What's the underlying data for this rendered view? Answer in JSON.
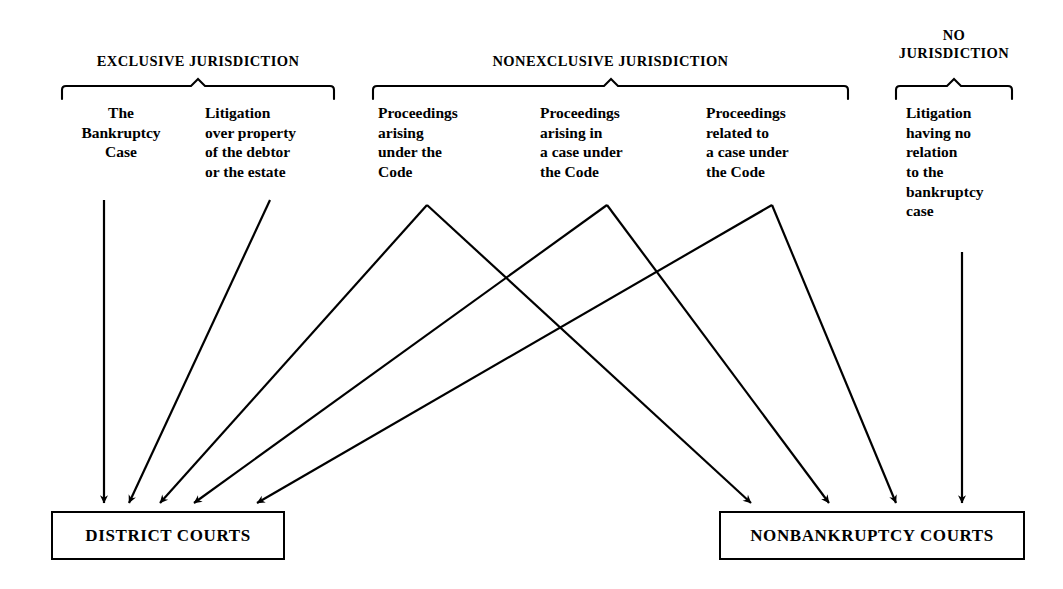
{
  "page": {
    "background_color": "#ffffff",
    "ink_color": "#000000"
  },
  "groups": [
    {
      "id": "exclusive",
      "heading": "EXCLUSIVE JURISDICTION",
      "brace": {
        "x_start": 62,
        "x_end": 334,
        "y": 86
      },
      "heading_box": {
        "x": 62,
        "y": 52,
        "width": 272
      }
    },
    {
      "id": "nonexclusive",
      "heading": "NONEXCLUSIVE JURISDICTION",
      "brace": {
        "x_start": 373,
        "x_end": 848,
        "y": 86
      },
      "heading_box": {
        "x": 373,
        "y": 52,
        "width": 475
      }
    },
    {
      "id": "none",
      "heading": "NO\nJURISDICTION",
      "brace": {
        "x_start": 896,
        "x_end": 1012,
        "y": 86
      },
      "heading_box": {
        "x": 896,
        "y": 26,
        "width": 116
      }
    }
  ],
  "columns": [
    {
      "id": "bankruptcy-case",
      "group": "exclusive",
      "label": "The\nBankruptcy\nCase",
      "align": "center",
      "box": {
        "x": 66,
        "y": 103,
        "width": 110
      }
    },
    {
      "id": "litigation-over-property",
      "group": "exclusive",
      "label": "Litigation\nover property\nof the debtor\nor the estate",
      "align": "left",
      "box": {
        "x": 205,
        "y": 103,
        "width": 130
      }
    },
    {
      "id": "arising-under-code",
      "group": "nonexclusive",
      "label": "Proceedings\narising\nunder the\nCode",
      "align": "left",
      "box": {
        "x": 378,
        "y": 103,
        "width": 125
      }
    },
    {
      "id": "arising-in-case-under-code",
      "group": "nonexclusive",
      "label": "Proceedings\narising in\na case under\nthe Code",
      "align": "left",
      "box": {
        "x": 540,
        "y": 103,
        "width": 135
      }
    },
    {
      "id": "related-to-case-under-code",
      "group": "nonexclusive",
      "label": "Proceedings\nrelated to\na case under\nthe Code",
      "align": "left",
      "box": {
        "x": 706,
        "y": 103,
        "width": 135
      }
    },
    {
      "id": "no-relation-litigation",
      "group": "none",
      "label": "Litigation\nhaving no\nrelation\nto the\nbankruptcy\ncase",
      "align": "left",
      "box": {
        "x": 906,
        "y": 103,
        "width": 110
      }
    }
  ],
  "court_boxes": [
    {
      "id": "district-courts",
      "label": "DISTRICT COURTS",
      "rect": {
        "x": 51,
        "y": 511,
        "width": 230,
        "height": 45
      }
    },
    {
      "id": "nonbankruptcy-courts",
      "label": "NONBANKRUPTCY COURTS",
      "rect": {
        "x": 719,
        "y": 511,
        "width": 302,
        "height": 45
      }
    }
  ],
  "connections": [
    {
      "id": "bankruptcy-case-to-district",
      "from": "bankruptcy-case",
      "to": "district-courts",
      "kind": "straight-vertical",
      "points": "104,200 104,505"
    },
    {
      "id": "property-to-district",
      "from": "litigation-over-property",
      "to": "district-courts",
      "kind": "diagonal",
      "points": "270,200 127,505"
    },
    {
      "id": "arising-under-to-district",
      "from": "arising-under-code",
      "to": "district-courts",
      "kind": "fork-left",
      "points": "427,204 158,505"
    },
    {
      "id": "arising-under-to-nonbankruptcy",
      "from": "arising-under-code",
      "to": "nonbankruptcy-courts",
      "kind": "fork-right",
      "points": "427,204 752,505"
    },
    {
      "id": "arising-in-to-district",
      "from": "arising-in-case-under-code",
      "to": "district-courts",
      "kind": "fork-left",
      "points": "607,204 192,505"
    },
    {
      "id": "arising-in-to-nonbankruptcy",
      "from": "arising-in-case-under-code",
      "to": "nonbankruptcy-courts",
      "kind": "fork-right",
      "points": "607,204 830,505"
    },
    {
      "id": "related-to-district",
      "from": "related-to-case-under-code",
      "to": "district-courts",
      "kind": "fork-left",
      "points": "772,204 255,505"
    },
    {
      "id": "related-to-nonbankruptcy",
      "from": "related-to-case-under-code",
      "to": "nonbankruptcy-courts",
      "kind": "fork-right",
      "points": "772,204 897,505"
    },
    {
      "id": "no-relation-to-nonbankruptcy",
      "from": "no-relation-litigation",
      "to": "nonbankruptcy-courts",
      "kind": "straight-vertical",
      "points": "962,252 962,505"
    }
  ],
  "arrow_counts": {
    "into_district_courts": 5,
    "into_nonbankruptcy_courts": 4
  }
}
